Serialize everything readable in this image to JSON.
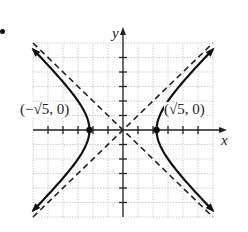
{
  "chart_data": {
    "type": "line",
    "title": "",
    "xlabel": "x",
    "ylabel": "y",
    "xlim": [
      -6,
      6
    ],
    "ylim": [
      -6,
      6
    ],
    "grid": true,
    "tick_step": 1,
    "equation": "x^2/5 - y^2/5 = 1",
    "series": [
      {
        "name": "hyperbola-right-branch",
        "style": "solid",
        "x_from": 2.236,
        "y_range": [
          -5.57,
          5.57
        ],
        "arrows": true
      },
      {
        "name": "hyperbola-left-branch",
        "style": "solid",
        "x_from": -2.236,
        "y_range": [
          -5.57,
          5.57
        ],
        "arrows": true
      },
      {
        "name": "asymptote-1",
        "style": "dashed",
        "equation": "y = x",
        "points": [
          [
            -6,
            -6
          ],
          [
            6,
            6
          ]
        ]
      },
      {
        "name": "asymptote-2",
        "style": "dashed",
        "equation": "y = -x",
        "points": [
          [
            -6,
            6
          ],
          [
            6,
            -6
          ]
        ]
      }
    ],
    "points": [
      {
        "label": "(−√5, 0)",
        "x": -2.236,
        "y": 0
      },
      {
        "label": "(√5, 0)",
        "x": 2.236,
        "y": 0
      }
    ]
  },
  "labels": {
    "x_axis": "x",
    "y_axis": "y",
    "left_vertex": "(−√5, 0)",
    "right_vertex": "(√5, 0)"
  }
}
